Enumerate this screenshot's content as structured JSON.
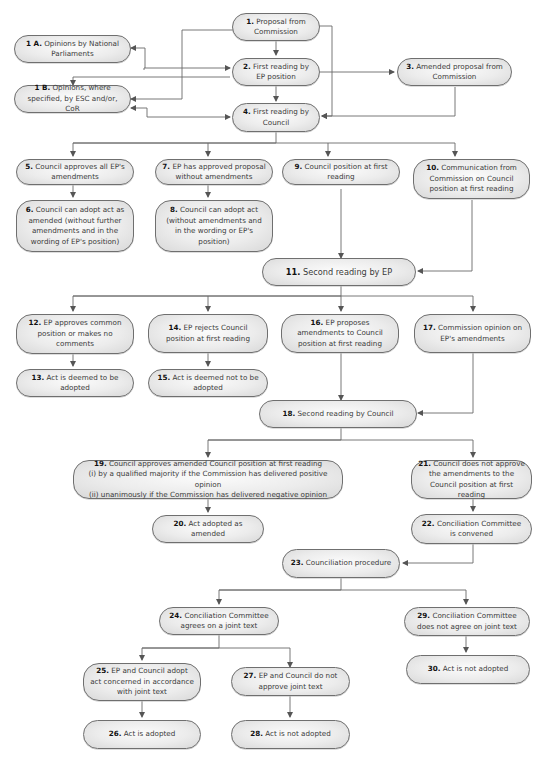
{
  "caption": "Fig. — co-decision (ordinary legislative) procedure",
  "colors": {
    "box_fill": "#e8e8e8",
    "box_border": "#6f6f6f",
    "line": "#6a6a6a",
    "text": "#3a3a3a"
  },
  "nodes": {
    "n1": {
      "num": "1.",
      "text": "Proposal from Commission"
    },
    "n1a": {
      "num": "1 A.",
      "text": "Opinions by National Parliaments"
    },
    "n1b": {
      "num": "1 B.",
      "text": "Opinions, where specified, by ESC and/or, CoR"
    },
    "n2": {
      "num": "2.",
      "text": "First reading by EP position"
    },
    "n3": {
      "num": "3.",
      "text": "Amended proposal from Commission"
    },
    "n4": {
      "num": "4.",
      "text": "First reading by Council"
    },
    "n5": {
      "num": "5.",
      "text": "Council approves all EP's amendments"
    },
    "n6": {
      "num": "6.",
      "text": "Council can adopt act as amended (without further amendments and in the wording of EP's position)"
    },
    "n7": {
      "num": "7.",
      "text": "EP has approved proposal without amendments"
    },
    "n8": {
      "num": "8.",
      "text": "Council can adopt act (without amendments and in the wording or EP's position)"
    },
    "n9": {
      "num": "9.",
      "text": "Council position at first reading"
    },
    "n10": {
      "num": "10.",
      "text": "Communication from Commission on Council position at first reading"
    },
    "n11": {
      "num": "11.",
      "text": "Second reading by EP"
    },
    "n12": {
      "num": "12.",
      "text": "EP approves common position or makes no comments"
    },
    "n13": {
      "num": "13.",
      "text": "Act is deemed to be adopted"
    },
    "n14": {
      "num": "14.",
      "text": "EP rejects Council position at first reading"
    },
    "n15": {
      "num": "15.",
      "text": "Act is deemed not to be adopted"
    },
    "n16": {
      "num": "16.",
      "text": "EP proposes amendments to Council position at first reading"
    },
    "n17": {
      "num": "17.",
      "text": "Commission opinion on EP's amendments"
    },
    "n18": {
      "num": "18.",
      "text": "Second reading by Council"
    },
    "n19": {
      "num": "19.",
      "text": "Council approves amended Council position at first reading",
      "line2": "(i) by a qualified majority if the Commission has delivered positive opinion",
      "line3": "(ii) unanimously if the Commission has delivered negative opinion"
    },
    "n20": {
      "num": "20.",
      "text": "Act adopted as amended"
    },
    "n21": {
      "num": "21.",
      "text": "Council does not approve the amendments to the Council position at first reading"
    },
    "n22": {
      "num": "22.",
      "text": "Conciliation Committee is convened"
    },
    "n23": {
      "num": "23.",
      "text": "Counciliation procedure"
    },
    "n24": {
      "num": "24.",
      "text": "Conciliation Committee agrees on a joint text"
    },
    "n25": {
      "num": "25.",
      "text": "EP and Council adopt act concerned in accordance with joint text"
    },
    "n26": {
      "num": "26.",
      "text": "Act is adopted"
    },
    "n27": {
      "num": "27.",
      "text": "EP and Council do not approve joint text"
    },
    "n28": {
      "num": "28.",
      "text": "Act is not adopted"
    },
    "n29": {
      "num": "29.",
      "text": "Conciliation Committee does not agree on joint text"
    },
    "n30": {
      "num": "30.",
      "text": "Act is not adopted"
    }
  }
}
